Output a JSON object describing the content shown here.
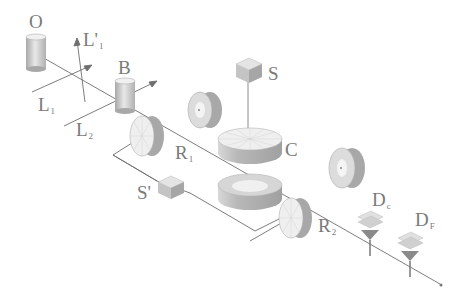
{
  "diagram": {
    "title": "",
    "labels": {
      "O": {
        "main": "O",
        "sub": ""
      },
      "L1prime": {
        "main": "L'",
        "sub": "1"
      },
      "B": {
        "main": "B",
        "sub": ""
      },
      "L1": {
        "main": "L",
        "sub": "1"
      },
      "L2": {
        "main": "L",
        "sub": "2"
      },
      "S": {
        "main": "S",
        "sub": ""
      },
      "C": {
        "main": "C",
        "sub": ""
      },
      "R1": {
        "main": "R",
        "sub": "1"
      },
      "Sprime": {
        "main": "S'",
        "sub": ""
      },
      "R2": {
        "main": "R",
        "sub": "2"
      },
      "Dc": {
        "main": "D",
        "sub": "c"
      },
      "DF": {
        "main": "D",
        "sub": "F"
      }
    },
    "components": [
      {
        "id": "O",
        "type": "cylinder",
        "desc": "source"
      },
      {
        "id": "B",
        "type": "cylinder",
        "desc": "beam splitter"
      },
      {
        "id": "S",
        "type": "cube",
        "desc": "sample"
      },
      {
        "id": "C",
        "type": "disk",
        "desc": "wheel"
      },
      {
        "id": "R1",
        "type": "wheel",
        "desc": "rotor 1"
      },
      {
        "id": "Sprime",
        "type": "cube",
        "desc": "reference sample"
      },
      {
        "id": "R2",
        "type": "wheel",
        "desc": "rotor 2"
      },
      {
        "id": "Dc",
        "type": "detector"
      },
      {
        "id": "DF",
        "type": "detector"
      }
    ],
    "colors": {
      "line": "#6e6e6e",
      "label": "#7a7a7a",
      "light_face": "#e2e2e2",
      "mid_face": "#bdbdbd",
      "dark_face": "#9a9a9a"
    }
  }
}
